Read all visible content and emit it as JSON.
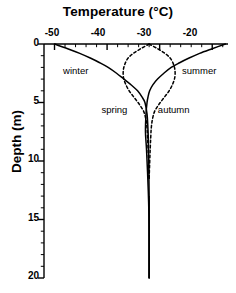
{
  "figure": {
    "axis_title_x": "Temperature (°C)",
    "axis_title_y": "Depth (m)",
    "line_color": "#000000",
    "background": "#ffffff"
  },
  "ticks": {
    "x_labels": [
      "-50",
      "-40",
      "-30",
      "-20"
    ],
    "y_labels": [
      "0",
      "5",
      "10",
      "15",
      "20"
    ]
  },
  "series_labels": {
    "winter": "winter",
    "summer": "summer",
    "spring": "spring",
    "autumn": "autumn"
  },
  "chart_data": {
    "type": "line",
    "title": "",
    "xlabel": "Temperature (°C)",
    "ylabel": "Depth (m)",
    "xlim": [
      -52,
      -17
    ],
    "ylim": [
      20,
      0
    ],
    "x_axis_position": "top",
    "y_axis_inverted": true,
    "grid": false,
    "legend": "inline-annotations",
    "xticks": [
      -50,
      -40,
      -30,
      -20
    ],
    "xticks_minor_step": 2,
    "yticks": [
      0,
      5,
      10,
      15,
      20
    ],
    "yticks_minor_step": 1,
    "series": [
      {
        "name": "winter",
        "style": "solid",
        "label_position": {
          "temperature": -46.0,
          "depth": 2.3
        },
        "x": [
          -50.0,
          -47.5,
          -45.2,
          -43.2,
          -41.4,
          -39.8,
          -38.2,
          -36.8,
          -35.4,
          -34.2,
          -33.4,
          -32.8,
          -32.4,
          -32.2,
          -32.1,
          -32.05,
          -32.0,
          -32.0,
          -32.0
        ],
        "depth": [
          0.0,
          0.4,
          0.8,
          1.2,
          1.6,
          2.0,
          2.5,
          3.0,
          3.5,
          4.0,
          4.5,
          5.0,
          6.0,
          7.5,
          9.0,
          11.0,
          13.5,
          16.0,
          20.0
        ]
      },
      {
        "name": "summer",
        "style": "solid",
        "label_position": {
          "temperature": -22.5,
          "depth": 2.3
        },
        "x": [
          -17.5,
          -20.0,
          -22.4,
          -24.4,
          -26.2,
          -27.8,
          -29.2,
          -30.4,
          -31.3,
          -31.9,
          -32.2,
          -32.4,
          -32.6,
          -32.7,
          -32.5,
          -32.3,
          -32.1,
          -32.0,
          -32.0
        ],
        "depth": [
          0.0,
          0.4,
          0.8,
          1.2,
          1.6,
          2.0,
          2.5,
          3.0,
          3.5,
          4.0,
          4.5,
          5.0,
          6.0,
          7.5,
          9.0,
          11.0,
          13.5,
          16.0,
          20.0
        ]
      },
      {
        "name": "spring",
        "style": "dashed",
        "label_position": {
          "temperature": -38.6,
          "depth": 5.6
        },
        "x": [
          -32.0,
          -33.6,
          -35.0,
          -36.0,
          -36.6,
          -36.9,
          -36.9,
          -36.5,
          -35.8,
          -34.8,
          -33.8,
          -33.0,
          -32.6,
          -32.4,
          -32.3,
          -32.2,
          -32.1,
          -32.0
        ],
        "depth": [
          0.0,
          0.4,
          0.8,
          1.2,
          1.7,
          2.2,
          2.8,
          3.4,
          4.0,
          4.6,
          5.2,
          5.8,
          6.5,
          7.2,
          8.0,
          9.0,
          10.2,
          11.5
        ]
      },
      {
        "name": "autumn",
        "style": "dashed",
        "label_position": {
          "temperature": -27.3,
          "depth": 5.6
        },
        "x": [
          -32.0,
          -30.4,
          -29.0,
          -28.0,
          -27.4,
          -27.1,
          -27.1,
          -27.5,
          -28.2,
          -29.2,
          -30.2,
          -31.0,
          -31.4,
          -31.6,
          -31.7,
          -31.8,
          -31.9,
          -32.0
        ],
        "depth": [
          0.0,
          0.4,
          0.8,
          1.2,
          1.7,
          2.2,
          2.8,
          3.4,
          4.0,
          4.6,
          5.2,
          5.8,
          6.5,
          7.2,
          8.0,
          9.0,
          10.2,
          11.5
        ]
      }
    ],
    "annotations": [
      {
        "text": "winter",
        "temperature": -46.0,
        "depth": 2.3
      },
      {
        "text": "summer",
        "temperature": -22.5,
        "depth": 2.3
      },
      {
        "text": "spring",
        "temperature": -38.6,
        "depth": 5.6
      },
      {
        "text": "autumn",
        "temperature": -27.3,
        "depth": 5.6
      }
    ],
    "notes": {
      "convergence_temperature": -32.0,
      "convergence_depth_approx": 14,
      "crossover_depth_solid_curves": 5.0
    }
  }
}
